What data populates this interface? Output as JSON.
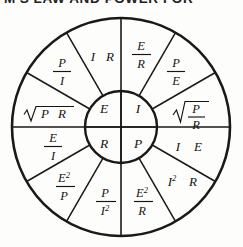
{
  "page": {
    "title": "M'S LAW AND POWER FOR",
    "title_note": "heading cropped at top edge",
    "background_color": "#fdfdfb",
    "ink_color": "#1b1917"
  },
  "diagram": {
    "name": "ohms-law-power-wheel",
    "center": {
      "x": 121,
      "y": 118,
      "outer_radius": 109,
      "inner_radius": 36
    },
    "center_quadrants": [
      {
        "id": "E",
        "label": "E",
        "position": "top-left",
        "meaning": "voltage"
      },
      {
        "id": "I",
        "label": "I",
        "position": "top-right",
        "meaning": "current"
      },
      {
        "id": "R",
        "label": "R",
        "position": "bottom-left",
        "meaning": "resistance"
      },
      {
        "id": "P",
        "label": "P",
        "position": "bottom-right",
        "meaning": "power"
      }
    ],
    "segments": [
      {
        "index": 0,
        "quadrant": "E",
        "kind": "plain",
        "text": "I R",
        "parts": [
          "I",
          "R"
        ]
      },
      {
        "index": 1,
        "quadrant": "E",
        "kind": "fraction",
        "text": "P / I",
        "numerator": "P",
        "denominator": "I"
      },
      {
        "index": 2,
        "quadrant": "E",
        "kind": "sqrt",
        "text": "√P R",
        "radicand": "P R"
      },
      {
        "index": 3,
        "quadrant": "R",
        "kind": "fraction",
        "text": "E / I",
        "numerator": "E",
        "denominator": "I"
      },
      {
        "index": 4,
        "quadrant": "R",
        "kind": "fraction",
        "text": "E² / P",
        "numerator": "E",
        "numerator_sup": "2",
        "denominator": "P"
      },
      {
        "index": 5,
        "quadrant": "R",
        "kind": "fraction",
        "text": "P / I²",
        "numerator": "P",
        "denominator": "I",
        "denominator_sup": "2"
      },
      {
        "index": 6,
        "quadrant": "P",
        "kind": "fraction",
        "text": "E² / R",
        "numerator": "E",
        "numerator_sup": "2",
        "denominator": "R"
      },
      {
        "index": 7,
        "quadrant": "P",
        "kind": "plain",
        "text": "I² R",
        "base": "I",
        "base_sup": "2",
        "tail": "R"
      },
      {
        "index": 8,
        "quadrant": "P",
        "kind": "plain",
        "text": "I E",
        "parts": [
          "I",
          "E"
        ]
      },
      {
        "index": 9,
        "quadrant": "I",
        "kind": "sqrt",
        "text": "√(P / R)",
        "numerator": "P",
        "denominator": "R"
      },
      {
        "index": 10,
        "quadrant": "I",
        "kind": "fraction",
        "text": "P / E",
        "numerator": "P",
        "denominator": "E"
      },
      {
        "index": 11,
        "quadrant": "I",
        "kind": "fraction",
        "text": "E / R",
        "numerator": "E",
        "denominator": "R"
      }
    ]
  }
}
